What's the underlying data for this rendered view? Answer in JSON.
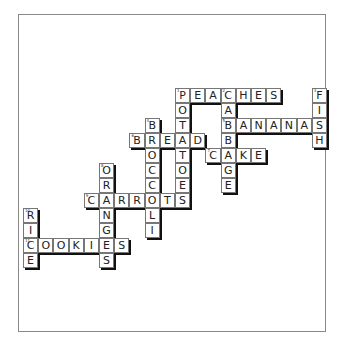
{
  "puzzle": {
    "title": "Food Crossword",
    "origin": {
      "x": 175,
      "y": 88
    },
    "cell": {
      "w": 15.2,
      "h": 15
    },
    "words": [
      {
        "n": "1",
        "word": "PEACHES",
        "dir": "across",
        "col": 0,
        "row": 0
      },
      {
        "n": "2",
        "word": "CABBAGE",
        "dir": "down",
        "col": 3,
        "row": 0
      },
      {
        "n": "3",
        "word": "FISH",
        "dir": "down",
        "col": 9,
        "row": 0
      },
      {
        "n": "1",
        "word": "POTATOES",
        "dir": "down",
        "col": 0,
        "row": 0
      },
      {
        "n": "4",
        "word": "BROCCOLI",
        "dir": "down",
        "col": -2,
        "row": 2
      },
      {
        "n": "5",
        "word": "BANANAS",
        "dir": "across",
        "col": 3,
        "row": 2
      },
      {
        "n": "6",
        "word": "BREAD",
        "dir": "across",
        "col": -3,
        "row": 3
      },
      {
        "n": "7",
        "word": "CAKE",
        "dir": "across",
        "col": 2,
        "row": 4
      },
      {
        "n": "8",
        "word": "ORANGES",
        "dir": "down",
        "col": -5,
        "row": 5
      },
      {
        "n": "9",
        "word": "CARROTS",
        "dir": "across",
        "col": -6,
        "row": 7
      },
      {
        "n": "10",
        "word": "RICE",
        "dir": "down",
        "col": -10,
        "row": 8
      },
      {
        "n": "11",
        "word": "COOKIES",
        "dir": "across",
        "col": -10,
        "row": 10
      }
    ]
  }
}
